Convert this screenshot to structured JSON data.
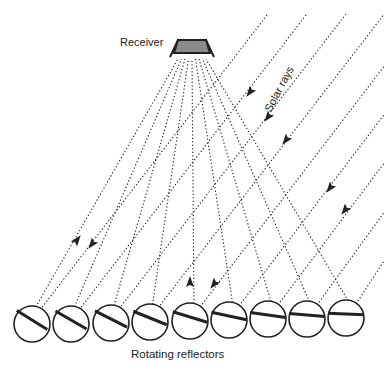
{
  "labels": {
    "receiver": "Receiver",
    "solar_rays": "Solar rays",
    "reflectors": "Rotating reflectors"
  },
  "colors": {
    "line": "#222222",
    "receiver_fill": "#8a8a8a",
    "background": "#ffffff"
  },
  "receiver": {
    "cx": 192,
    "top": 40,
    "bottom": 57,
    "top_half_width": 14,
    "bottom_half_width": 22
  },
  "reflectors": [
    {
      "cx": 32,
      "cy": 324,
      "r": 18,
      "angle": 32
    },
    {
      "cx": 71,
      "cy": 324,
      "r": 18,
      "angle": 30
    },
    {
      "cx": 111,
      "cy": 323,
      "r": 18,
      "angle": 27
    },
    {
      "cx": 150,
      "cy": 322,
      "r": 18,
      "angle": 22
    },
    {
      "cx": 190,
      "cy": 321,
      "r": 18,
      "angle": 17
    },
    {
      "cx": 229,
      "cy": 320,
      "r": 18,
      "angle": 12
    },
    {
      "cx": 268,
      "cy": 319,
      "r": 18,
      "angle": 8
    },
    {
      "cx": 307,
      "cy": 319,
      "r": 18,
      "angle": 5
    },
    {
      "cx": 346,
      "cy": 318,
      "r": 18,
      "angle": 2
    }
  ],
  "arrows": [
    {
      "x": 77,
      "y": 240,
      "dir": "up-right"
    },
    {
      "x": 92,
      "y": 244,
      "dir": "down-left"
    },
    {
      "x": 190,
      "y": 282,
      "dir": "up"
    },
    {
      "x": 214,
      "y": 284,
      "dir": "down-left"
    },
    {
      "x": 250,
      "y": 92,
      "dir": "down-left"
    },
    {
      "x": 268,
      "y": 117,
      "dir": "down-left"
    },
    {
      "x": 286,
      "y": 140,
      "dir": "down-left"
    },
    {
      "x": 330,
      "y": 188,
      "dir": "down-left"
    },
    {
      "x": 345,
      "y": 210,
      "dir": "down-left"
    }
  ]
}
